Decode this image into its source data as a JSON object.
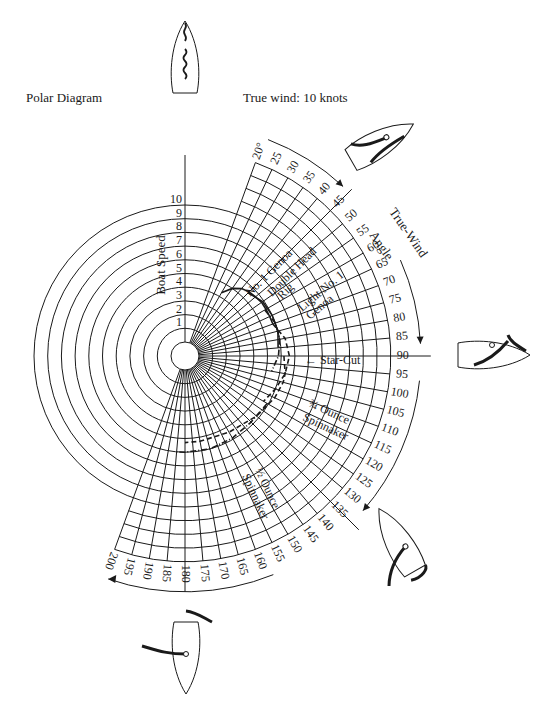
{
  "header": {
    "title": "Polar Diagram",
    "subtitle": "True wind: 10 knots"
  },
  "axes": {
    "radial_label": "Boat Speed",
    "radial_ticks": [
      "1",
      "2",
      "3",
      "4",
      "5",
      "6",
      "7",
      "8",
      "9",
      "10"
    ],
    "angular_label": "True-Wind Angle",
    "angular_ticks": [
      "20°",
      "25",
      "30",
      "35",
      "40",
      "45",
      "50",
      "55",
      "60",
      "65",
      "70",
      "75",
      "80",
      "85",
      "90",
      "95",
      "100",
      "105",
      "110",
      "115",
      "120",
      "125",
      "130",
      "135",
      "140",
      "145",
      "150",
      "155",
      "160",
      "165",
      "170",
      "175",
      "180",
      "185",
      "190",
      "195",
      "200"
    ]
  },
  "curve_labels": {
    "no1_genoa": "No. 1 Genoa",
    "double_head_rig_1": "Double Head",
    "double_head_rig_2": "Rig",
    "light_no1_genoa_1": "Light No. 1",
    "light_no1_genoa_2": "Genoa",
    "star_cut": "Star-Cut",
    "three_quarter_ounce_1": "¾ Ounce",
    "three_quarter_ounce_2": "Spinnaker",
    "half_ounce_1": "½ Ounce",
    "half_ounce_2": "Spinnaker"
  },
  "boats": [
    {
      "name": "boat-head-to-wind",
      "angle": 0
    },
    {
      "name": "boat-close-hauled",
      "angle": 45
    },
    {
      "name": "boat-beam-reach",
      "angle": 90
    },
    {
      "name": "boat-broad-reach",
      "angle": 135
    },
    {
      "name": "boat-running",
      "angle": 180
    }
  ],
  "chart_data": {
    "type": "polar",
    "title": "Polar Diagram",
    "subtitle": "True wind: 10 knots",
    "radial_axis": {
      "label": "Boat Speed",
      "min": 0,
      "max": 10,
      "ticks": [
        1,
        2,
        3,
        4,
        5,
        6,
        7,
        8,
        9,
        10
      ]
    },
    "angular_axis": {
      "label": "True-Wind Angle",
      "min": 20,
      "max": 200,
      "step": 5,
      "unit": "deg"
    },
    "grid": true,
    "series": [
      {
        "name": "No. 1 Genoa",
        "style": "solid",
        "points": [
          [
            30,
            4.3
          ],
          [
            35,
            5.0
          ],
          [
            40,
            5.4
          ],
          [
            45,
            5.6
          ],
          [
            50,
            5.7
          ],
          [
            55,
            5.8
          ],
          [
            60,
            5.8
          ],
          [
            65,
            5.8
          ],
          [
            70,
            5.8
          ]
        ]
      },
      {
        "name": "Double Head Rig",
        "style": "solid",
        "points": [
          [
            45,
            5.5
          ],
          [
            55,
            5.9
          ],
          [
            65,
            6.0
          ],
          [
            75,
            6.0
          ],
          [
            85,
            5.8
          ]
        ]
      },
      {
        "name": "Light No. 1 Genoa",
        "style": "dash-dot",
        "points": [
          [
            60,
            5.7
          ],
          [
            70,
            6.0
          ],
          [
            80,
            6.0
          ],
          [
            90,
            5.8
          ],
          [
            100,
            5.4
          ]
        ]
      },
      {
        "name": "Star-Cut",
        "style": "dashed",
        "points": [
          [
            70,
            5.8
          ],
          [
            80,
            6.4
          ],
          [
            90,
            6.6
          ],
          [
            100,
            6.4
          ],
          [
            110,
            6.0
          ],
          [
            120,
            5.6
          ]
        ]
      },
      {
        "name": "¾ Ounce Spinnaker",
        "style": "dashed",
        "points": [
          [
            90,
            6.2
          ],
          [
            100,
            6.4
          ],
          [
            105,
            6.4
          ],
          [
            115,
            6.2
          ],
          [
            130,
            5.8
          ],
          [
            150,
            5.4
          ],
          [
            170,
            5.3
          ],
          [
            180,
            5.3
          ]
        ]
      },
      {
        "name": "½ Ounce Spinnaker",
        "style": "dash-dot",
        "points": [
          [
            120,
            5.9
          ],
          [
            135,
            5.8
          ],
          [
            150,
            5.9
          ],
          [
            165,
            6.0
          ],
          [
            180,
            6.0
          ],
          [
            185,
            6.0
          ]
        ]
      }
    ]
  }
}
